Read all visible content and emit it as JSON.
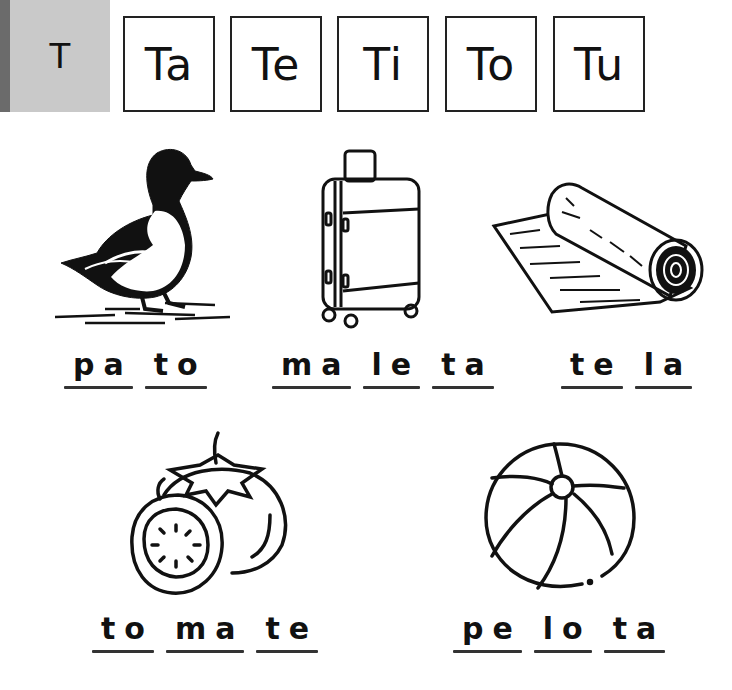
{
  "header": {
    "letter": "T",
    "syllables": [
      "Ta",
      "Te",
      "Ti",
      "To",
      "Tu"
    ]
  },
  "items": [
    {
      "name": "pato",
      "picture": "duck",
      "syllables": [
        "pa",
        "to"
      ]
    },
    {
      "name": "maleta",
      "picture": "suitcase",
      "syllables": [
        "ma",
        "le",
        "ta"
      ]
    },
    {
      "name": "tela",
      "picture": "fabric-roll",
      "syllables": [
        "te",
        "la"
      ]
    },
    {
      "name": "tomate",
      "picture": "tomato",
      "syllables": [
        "to",
        "ma",
        "te"
      ]
    },
    {
      "name": "pelota",
      "picture": "beach-ball",
      "syllables": [
        "pe",
        "lo",
        "ta"
      ]
    }
  ],
  "colors": {
    "header_block": "#c9c9c9",
    "header_strip": "#6b6b6b",
    "ink": "#1a1a1a"
  }
}
